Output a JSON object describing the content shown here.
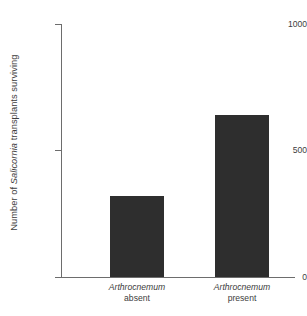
{
  "chart_data": {
    "type": "bar",
    "title": "",
    "xlabel": "",
    "ylabel": "Number of Salicornia transplants surviving",
    "ylabel_italic_part": "Salicornia",
    "ylim": [
      0,
      1000
    ],
    "yticks": [
      0,
      500,
      1000
    ],
    "ytick_labels": [
      "0",
      "500",
      "1000"
    ],
    "grid": false,
    "legend": false,
    "categories": [
      "Arthrocnemum absent",
      "Arthrocnemum present"
    ],
    "category_labels": [
      {
        "species": "Arthrocnemum",
        "state": "absent"
      },
      {
        "species": "Arthrocnemum",
        "state": "present"
      }
    ],
    "values": [
      320,
      640
    ],
    "bar_color": "#2e2e2e",
    "axis_color": "#6d6d6d",
    "background_color": "#ffffff"
  }
}
